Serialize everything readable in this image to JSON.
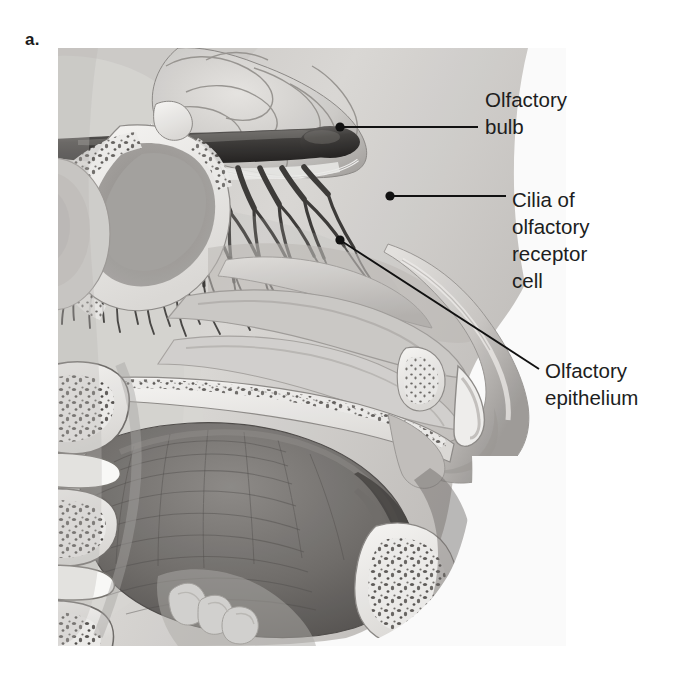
{
  "figure": {
    "panel_letter": "a.",
    "type": "anatomical-illustration",
    "style": "grayscale medical illustration"
  },
  "labels": [
    {
      "id": "olfactory-bulb",
      "text": "Olfactory\nbulb",
      "lines": [
        "Olfactory",
        "bulb"
      ],
      "leader": {
        "type": "horizontal",
        "from_x": 337,
        "from_y": 127,
        "to_x": 478,
        "to_y": 127,
        "dot": true
      }
    },
    {
      "id": "cilia-of-olfactory-receptor-cell",
      "text": "Cilia of\nolfactory\nreceptor\ncell",
      "lines": [
        "Cilia of",
        "olfactory",
        "receptor",
        "cell"
      ],
      "leader": {
        "type": "horizontal",
        "from_x": 389,
        "from_y": 196,
        "to_x": 505,
        "to_y": 196,
        "dot": true
      }
    },
    {
      "id": "olfactory-epithelium",
      "text": "Olfactory\nepithelium",
      "lines": [
        "Olfactory",
        "epithelium"
      ],
      "leader": {
        "type": "diagonal",
        "from_x": 339,
        "from_y": 240,
        "to_x": 538,
        "to_y": 368,
        "dot": true
      }
    }
  ],
  "anatomy": {
    "structures": [
      "brain frontal lobe",
      "olfactory bulb",
      "olfactory nerve fibers / cilia",
      "cribriform plate",
      "sphenoid sinus",
      "nasal conchae",
      "nasal cavity",
      "nose",
      "hard palate",
      "upper teeth",
      "tongue",
      "mandible",
      "oral cavity",
      "pharynx",
      "epiglottis",
      "cervical vertebrae",
      "intervertebral discs",
      "spinal cord"
    ]
  },
  "colors": {
    "background": "#ffffff",
    "text": "#201d1d",
    "leader_line": "#111111",
    "tissue_light": "#d8d6d4",
    "tissue_mid": "#b4b1ae",
    "tissue_dark": "#7d7a78",
    "bone_white": "#f2f1ef",
    "bone_speckle": "#4a4846",
    "bulb_dark": "#3a3836",
    "tongue_dark": "#6d6a67"
  }
}
